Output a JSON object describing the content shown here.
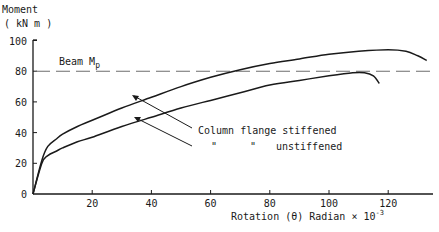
{
  "chart_data": {
    "type": "line",
    "title": "",
    "ylabel": "Moment",
    "ylabel_units": "( kN m )",
    "xlabel": "Rotation  (θ)  Radian  × 10",
    "xlabel_exponent": "-3",
    "xlim": [
      0,
      133
    ],
    "ylim": [
      0,
      100
    ],
    "xticks": [
      20,
      40,
      60,
      80,
      100,
      120
    ],
    "yticks": [
      0,
      20,
      40,
      60,
      80,
      100
    ],
    "grid": false,
    "reference_line": {
      "label": "Beam  Mp",
      "label_main": "Beam  M",
      "label_sub": "p",
      "y": 80,
      "style": "dashed"
    },
    "series": [
      {
        "name": "Column flange stiffened",
        "x": [
          0,
          3,
          5,
          8,
          10,
          15,
          20,
          30,
          40,
          50,
          60,
          70,
          80,
          90,
          100,
          110,
          120,
          126,
          130,
          133
        ],
        "y": [
          0,
          22,
          31,
          36,
          39,
          44,
          48,
          56,
          63,
          70,
          76,
          81,
          85,
          88,
          91,
          93,
          94,
          93,
          90,
          87
        ]
      },
      {
        "name": "Column flange unstiffened",
        "x": [
          0,
          3,
          5,
          8,
          10,
          15,
          20,
          30,
          40,
          50,
          60,
          70,
          80,
          90,
          100,
          108,
          112,
          115,
          117
        ],
        "y": [
          0,
          20,
          25,
          28,
          30,
          34,
          37,
          44,
          50,
          56,
          61,
          66,
          71,
          74,
          77,
          79,
          79,
          77,
          72
        ]
      }
    ],
    "annotations": [
      {
        "text": "Column flange stiffened",
        "points_to": "Column flange stiffened"
      },
      {
        "text": "\"        \"    unstiffened",
        "points_to": "Column flange unstiffened"
      }
    ]
  },
  "labels": {
    "y_title": "Moment",
    "y_units": "( kN m )",
    "x_title": "Rotation  (θ)  Radian  × 10",
    "x_exp": "-3",
    "ref_main": "Beam  M",
    "ref_sub": "p",
    "ann_stiff": "Column flange stiffened",
    "ann_ditto1": "\"",
    "ann_ditto2": "\"",
    "ann_unstiff": "unstiffened",
    "xtick": [
      "20",
      "40",
      "60",
      "80",
      "100",
      "120"
    ],
    "ytick": [
      "0",
      "20",
      "40",
      "60",
      "80",
      "100"
    ]
  },
  "colors": {
    "ink": "#1a1a1a",
    "dash": "#6e6e6e"
  }
}
